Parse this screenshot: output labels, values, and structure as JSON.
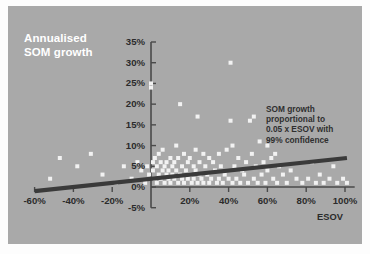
{
  "chart_title": "Annualised\nSOM growth",
  "annotation": "SOM growth\nproportional to\n0.05 x ESOV with\n99% confidence",
  "xaxis_title": "ESOV",
  "colors": {
    "panel_background": "#a9a9a9",
    "page_background": "#fdfdfd",
    "title_text": "#ffffff",
    "label_text": "#2b2b2b",
    "axis_line": "#4a4a4a",
    "trend_line": "#3a3a3a",
    "marker_fill": "#f2f2f2"
  },
  "chart_data": {
    "type": "scatter",
    "title": "Annualised SOM growth",
    "xlabel": "ESOV",
    "ylabel": "Annualised SOM growth",
    "xlim": [
      -60,
      105
    ],
    "ylim": [
      -5,
      35
    ],
    "xticks": [
      -60,
      -40,
      -20,
      0,
      20,
      40,
      60,
      80,
      100
    ],
    "xtick_labels": [
      "-60%",
      "-40%",
      "-20%",
      "0%",
      "20%",
      "40%",
      "60%",
      "80%",
      "100%"
    ],
    "yticks": [
      -5,
      0,
      5,
      10,
      15,
      20,
      25,
      30,
      35
    ],
    "ytick_labels": [
      "-5%",
      "0%",
      "5%",
      "10%",
      "15%",
      "20%",
      "25%",
      "30%",
      "35%"
    ],
    "grid": false,
    "legend": "none",
    "annotations": [
      {
        "text": "SOM growth proportional to 0.05 x ESOV with 99% confidence",
        "x": 60,
        "y": 20
      }
    ],
    "series": [
      {
        "name": "Brands",
        "marker": "square",
        "points": [
          [
            -52,
            2
          ],
          [
            -47,
            7
          ],
          [
            -38,
            5
          ],
          [
            -31,
            8
          ],
          [
            -25,
            3
          ],
          [
            -18,
            1
          ],
          [
            -14,
            5
          ],
          [
            -10,
            2
          ],
          [
            -7,
            6
          ],
          [
            -5,
            4
          ],
          [
            -3,
            1
          ],
          [
            -2,
            5
          ],
          [
            -1,
            3
          ],
          [
            0,
            25
          ],
          [
            0,
            24
          ],
          [
            1,
            6
          ],
          [
            1,
            4
          ],
          [
            2,
            7
          ],
          [
            2,
            2
          ],
          [
            3,
            5
          ],
          [
            3,
            1
          ],
          [
            4,
            8
          ],
          [
            4,
            3
          ],
          [
            5,
            6
          ],
          [
            5,
            2
          ],
          [
            6,
            4
          ],
          [
            6,
            9
          ],
          [
            7,
            5
          ],
          [
            7,
            1
          ],
          [
            8,
            3
          ],
          [
            8,
            6
          ],
          [
            9,
            2
          ],
          [
            9,
            4
          ],
          [
            10,
            7
          ],
          [
            10,
            1
          ],
          [
            11,
            5
          ],
          [
            11,
            3
          ],
          [
            12,
            2
          ],
          [
            12,
            6
          ],
          [
            13,
            10
          ],
          [
            13,
            4
          ],
          [
            14,
            1
          ],
          [
            14,
            7
          ],
          [
            15,
            20
          ],
          [
            15,
            3
          ],
          [
            16,
            5
          ],
          [
            16,
            2
          ],
          [
            17,
            8
          ],
          [
            17,
            1
          ],
          [
            18,
            4
          ],
          [
            19,
            6
          ],
          [
            19,
            2
          ],
          [
            20,
            7
          ],
          [
            20,
            3
          ],
          [
            21,
            1
          ],
          [
            22,
            5
          ],
          [
            22,
            2
          ],
          [
            23,
            9
          ],
          [
            23,
            4
          ],
          [
            24,
            17
          ],
          [
            24,
            1
          ],
          [
            25,
            6
          ],
          [
            25,
            3
          ],
          [
            26,
            2
          ],
          [
            27,
            8
          ],
          [
            27,
            1
          ],
          [
            28,
            5
          ],
          [
            29,
            3
          ],
          [
            30,
            7
          ],
          [
            30,
            1
          ],
          [
            31,
            2
          ],
          [
            32,
            6
          ],
          [
            33,
            4
          ],
          [
            34,
            1
          ],
          [
            35,
            8
          ],
          [
            35,
            2
          ],
          [
            36,
            5
          ],
          [
            37,
            1
          ],
          [
            38,
            3
          ],
          [
            39,
            9
          ],
          [
            40,
            2
          ],
          [
            41,
            30
          ],
          [
            41,
            16
          ],
          [
            42,
            10
          ],
          [
            42,
            1
          ],
          [
            43,
            5
          ],
          [
            44,
            2
          ],
          [
            45,
            7
          ],
          [
            46,
            1
          ],
          [
            47,
            4
          ],
          [
            48,
            3
          ],
          [
            49,
            6
          ],
          [
            50,
            1
          ],
          [
            51,
            16
          ],
          [
            52,
            8
          ],
          [
            53,
            17
          ],
          [
            53,
            2
          ],
          [
            54,
            5
          ],
          [
            55,
            1
          ],
          [
            56,
            11
          ],
          [
            57,
            3
          ],
          [
            58,
            6
          ],
          [
            59,
            1
          ],
          [
            60,
            10
          ],
          [
            60,
            4
          ],
          [
            62,
            7
          ],
          [
            63,
            2
          ],
          [
            64,
            8
          ],
          [
            65,
            1
          ],
          [
            66,
            5
          ],
          [
            68,
            3
          ],
          [
            70,
            1
          ],
          [
            72,
            4
          ],
          [
            75,
            2
          ],
          [
            78,
            1
          ],
          [
            81,
            2
          ],
          [
            83,
            6
          ],
          [
            85,
            1
          ],
          [
            87,
            3
          ],
          [
            89,
            1
          ],
          [
            92,
            2
          ],
          [
            94,
            5
          ],
          [
            96,
            1
          ],
          [
            99,
            2
          ],
          [
            101,
            1
          ]
        ]
      }
    ],
    "trend_line": {
      "label": "SOM growth proportional to 0.05 x ESOV",
      "slope": 0.05,
      "x_start": -60,
      "y_start": -1,
      "x_end": 101,
      "y_end": 7
    }
  }
}
